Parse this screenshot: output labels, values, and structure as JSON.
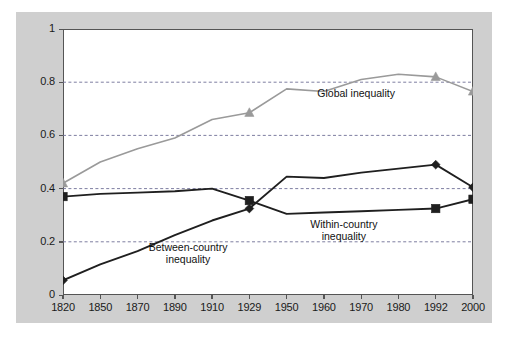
{
  "chart_data": {
    "type": "line",
    "title": "",
    "subtitle": "",
    "xlabel": "",
    "ylabel": "",
    "categories": [
      "1820",
      "1850",
      "1870",
      "1890",
      "1910",
      "1929",
      "1950",
      "1960",
      "1970",
      "1980",
      "1992",
      "2000"
    ],
    "ylim": [
      0,
      1
    ],
    "xlim_categorical": true,
    "ytick_labels": [
      "0",
      "0.2",
      "0.4",
      "0.6",
      "0.8",
      "1"
    ],
    "ytick_values": [
      0,
      0.2,
      0.4,
      0.6,
      0.8,
      1
    ],
    "grid": "horizontal-dashed",
    "legend_position": "inline-annotations",
    "series": [
      {
        "name": "Global inequality",
        "color": "#9a9a9a",
        "marker": "triangle",
        "marker_color": "#9a9a9a",
        "marker_at": [
          "1820",
          "1929",
          "1992",
          "2000"
        ],
        "values": [
          0.42,
          0.5,
          0.55,
          0.59,
          0.66,
          0.685,
          0.775,
          0.765,
          0.81,
          0.83,
          0.82,
          0.765
        ]
      },
      {
        "name": "Between-country inequality",
        "color": "#1f1f1f",
        "marker": "diamond",
        "marker_color": "#1f1f1f",
        "marker_at": [
          "1820",
          "1929",
          "1992",
          "2000"
        ],
        "values": [
          0.055,
          0.115,
          0.165,
          0.225,
          0.28,
          0.325,
          0.445,
          0.44,
          0.46,
          0.475,
          0.49,
          0.405
        ]
      },
      {
        "name": "Within-country inequality",
        "color": "#1f1f1f",
        "marker": "square",
        "marker_color": "#1f1f1f",
        "marker_at": [
          "1820",
          "1929",
          "1992",
          "2000"
        ],
        "values": [
          0.37,
          0.38,
          0.385,
          0.39,
          0.4,
          0.355,
          0.305,
          0.31,
          0.315,
          0.32,
          0.325,
          0.36
        ]
      }
    ],
    "annotations": [
      {
        "id": "global",
        "text_line1": "Global inequality",
        "text_line2": "",
        "x_frac": 0.715,
        "y_val": 0.755
      },
      {
        "id": "within",
        "text_line1": "Within-country",
        "text_line2": "inequality",
        "x_frac": 0.685,
        "y_val": 0.265
      },
      {
        "id": "between",
        "text_line1": "Between-country",
        "text_line2": "inequality",
        "x_frac": 0.305,
        "y_val": 0.175
      }
    ]
  },
  "figure": {
    "background_color": "#cfcfcf",
    "plot_background_color": "#ffffff",
    "frame_color": "#555555",
    "gridline_color": "#6f6f96"
  }
}
